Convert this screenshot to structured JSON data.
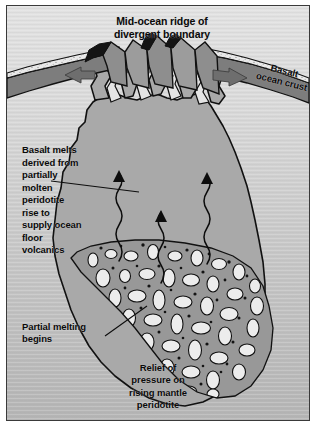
{
  "figure": {
    "kind": "geological-cross-section",
    "title": "Mid-ocean ridge of\ndivergent boundary",
    "labels": {
      "title": "Mid-ocean ridge of\ndivergent boundary",
      "basalt_ocean_crust": "Basalt\nocean crust",
      "basalt_melts": "Basalt melts\nderived from\npartially\nmolten\nperidotite\nrise to\nsupply ocean\nfloor\nvolcanics",
      "partial_melting": "Partial melting\nbegins",
      "relief_of_pressure": "Relief of\npressure on\nrising mantle\nperidotite"
    },
    "icons": {
      "spreading_arrow_left": "arrow-left-icon",
      "spreading_arrow_right": "arrow-right-icon",
      "rising_melt_arrow": "wavy-arrow-up-icon",
      "leader_line": "leader-line-icon"
    },
    "counts": {
      "rising_melt_arrows": 3,
      "spreading_arrows": 2
    },
    "colors": {
      "frame_border": "#3a3a3a",
      "background_upper": "#dcdcdc",
      "background_lower": "#b8b8b8",
      "ocean_crust": "#7e7e7e",
      "sediment_veneer": "#e8e8e8",
      "magma_body": "#a8a8a8",
      "melt_zone": "#9a9a9a",
      "crystal_blob": "#e6e6e6",
      "lava_pocket": "#101010",
      "spreading_arrow": "#6a6a6a",
      "outline": "#101010",
      "text": "#0a0a0a"
    }
  }
}
